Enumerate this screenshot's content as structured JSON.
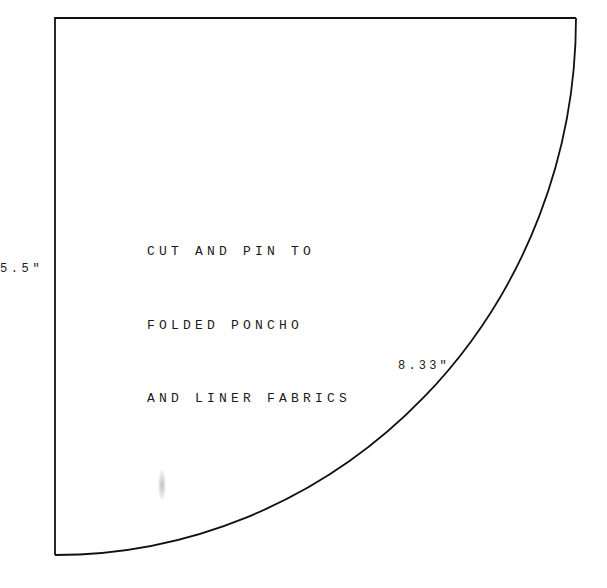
{
  "pattern": {
    "shape": "quarter-circle",
    "stroke_color": "#111111",
    "instructions": [
      "CUT AND PIN TO",
      "FOLDED PONCHO",
      "AND LINER FABRICS"
    ],
    "dimensions": {
      "radius_label": "5.5\"",
      "arc_label": "8.33\""
    }
  }
}
